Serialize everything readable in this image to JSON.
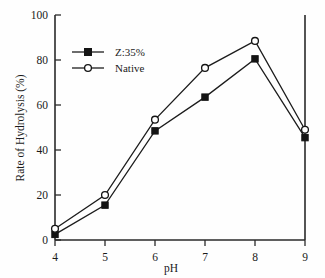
{
  "chart_data": {
    "type": "line",
    "title": "",
    "subtitle": "",
    "xlabel": "pH",
    "ylabel": "Rate of Hydrolysis (%)",
    "x": [
      4,
      5,
      6,
      7,
      8,
      9
    ],
    "xticklabels": [
      "4",
      "5",
      "6",
      "7",
      "8",
      "9"
    ],
    "yticklabels": [
      "0",
      "20",
      "40",
      "60",
      "80",
      "100"
    ],
    "yticks": [
      0,
      20,
      40,
      60,
      80,
      100
    ],
    "xlim": [
      4,
      9
    ],
    "ylim": [
      0,
      100
    ],
    "grid": false,
    "legend_position": "upper-left-inside",
    "series": [
      {
        "name": "Z:35%",
        "marker": "filled-square",
        "values": [
          2.5,
          15.5,
          48.5,
          63.5,
          80.5,
          45.5
        ]
      },
      {
        "name": "Native",
        "marker": "open-circle",
        "values": [
          5.0,
          20.0,
          53.5,
          76.5,
          88.5,
          49.0
        ]
      }
    ],
    "colors": {
      "line": "#1c1c1c",
      "marker_fill": "#141414",
      "marker_open_fill": "#ffffff",
      "axis": "#2a2a2a",
      "background": "#fefefe"
    }
  },
  "legend": {
    "entries": [
      {
        "label": "Z:35%"
      },
      {
        "label": "Native"
      }
    ]
  },
  "axes": {
    "x_title": "pH",
    "y_title": "Rate of Hydrolysis (%)",
    "x_tick_0": "4",
    "x_tick_1": "5",
    "x_tick_2": "6",
    "x_tick_3": "7",
    "x_tick_4": "8",
    "x_tick_5": "9",
    "y_tick_0": "0",
    "y_tick_1": "20",
    "y_tick_2": "40",
    "y_tick_3": "60",
    "y_tick_4": "80",
    "y_tick_5": "100"
  }
}
